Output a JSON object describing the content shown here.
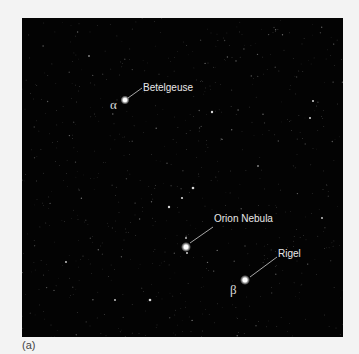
{
  "figure": {
    "caption": "(a)",
    "background": "#030303",
    "labels": {
      "betelgeuse": {
        "name": "Betelgeuse",
        "greek": "α"
      },
      "orion_nebula": {
        "name": "Orion Nebula"
      },
      "rigel": {
        "name": "Rigel",
        "greek": "β"
      }
    }
  }
}
